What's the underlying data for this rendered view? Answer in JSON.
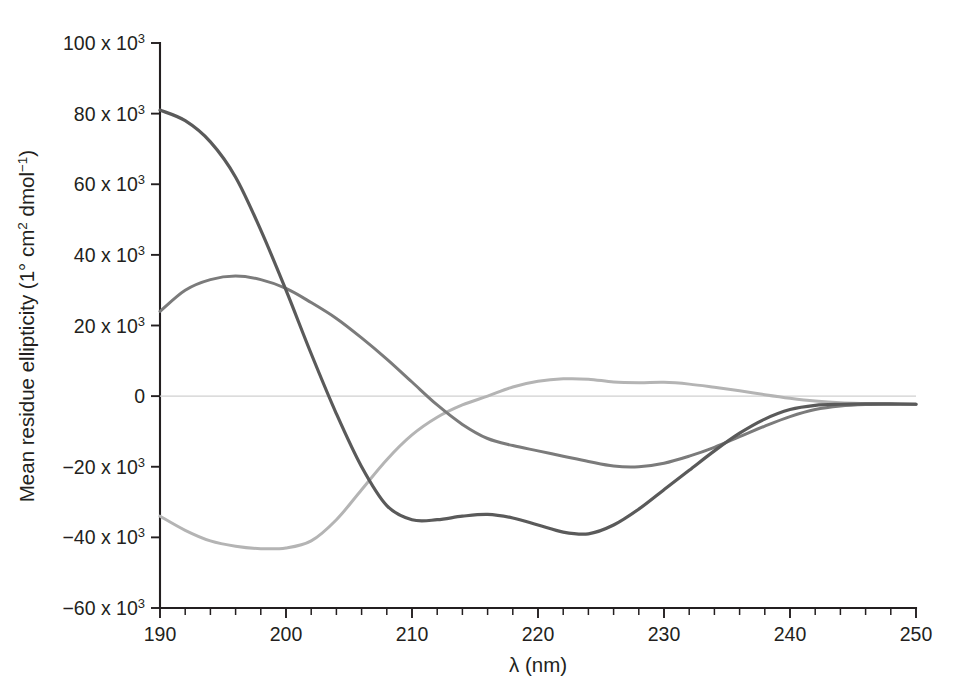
{
  "chart_data": {
    "type": "line",
    "title": "",
    "xlabel": "λ (nm)",
    "ylabel": "Mean residue ellipticity (1° cm2 dmol−1)",
    "ylabel_parts": {
      "lead": "Mean residue ellipticity (1° cm",
      "sup1": "2",
      "mid": " dmol",
      "sup2": "−1",
      "tail": ")"
    },
    "xlim": [
      190,
      250
    ],
    "ylim": [
      -60000,
      100000
    ],
    "grid": false,
    "legend": "none",
    "x_ticks_major": [
      190,
      200,
      210,
      220,
      230,
      240,
      250
    ],
    "x_tick_labels": [
      "190",
      "200",
      "210",
      "220",
      "230",
      "240",
      "250"
    ],
    "x_tick_minor_step": 2,
    "y_ticks_major": [
      100000,
      80000,
      60000,
      40000,
      20000,
      0,
      -20000,
      -40000,
      -60000
    ],
    "y_tick_labels": [
      {
        "mantissa": "100 x 10",
        "exponent": "3"
      },
      {
        "mantissa": "80 x 10",
        "exponent": "3"
      },
      {
        "mantissa": "60 x 10",
        "exponent": "3"
      },
      {
        "mantissa": "40 x 10",
        "exponent": "3"
      },
      {
        "mantissa": "20 x 10",
        "exponent": "3"
      },
      {
        "mantissa": "0",
        "exponent": ""
      },
      {
        "mantissa": "−20 x 10",
        "exponent": "3"
      },
      {
        "mantissa": "−40 x 10",
        "exponent": "3"
      },
      {
        "mantissa": "−60 x 10",
        "exponent": "3"
      }
    ],
    "x": [
      190,
      192,
      194,
      196,
      198,
      200,
      202,
      204,
      206,
      208,
      210,
      212,
      214,
      216,
      218,
      220,
      222,
      224,
      226,
      228,
      230,
      232,
      234,
      236,
      238,
      240,
      242,
      244,
      246,
      248,
      250
    ],
    "series": [
      {
        "name": "alpha-helix",
        "color": "#5a5a5a",
        "width": 3.2,
        "values": [
          81000,
          78000,
          72000,
          62000,
          47000,
          30000,
          12000,
          -5000,
          -20000,
          -31000,
          -35000,
          -35000,
          -34000,
          -33500,
          -34500,
          -36500,
          -38500,
          -39000,
          -36500,
          -32000,
          -26500,
          -21000,
          -15500,
          -10500,
          -6500,
          -3800,
          -2600,
          -2300,
          -2200,
          -2200,
          -2300
        ]
      },
      {
        "name": "beta-sheet",
        "color": "#7b7b7b",
        "width": 3.0,
        "values": [
          24000,
          30000,
          33000,
          34000,
          33000,
          30500,
          26500,
          22000,
          16500,
          10500,
          4000,
          -2500,
          -8000,
          -12000,
          -14000,
          -15500,
          -17000,
          -18500,
          -19800,
          -20000,
          -19000,
          -17000,
          -14500,
          -11500,
          -8500,
          -5800,
          -3800,
          -2800,
          -2400,
          -2300,
          -2300
        ]
      },
      {
        "name": "random-coil",
        "color": "#b4b4b4",
        "width": 3.0,
        "values": [
          -34000,
          -38000,
          -41000,
          -42500,
          -43200,
          -43000,
          -41000,
          -35000,
          -26500,
          -18000,
          -11000,
          -6000,
          -2500,
          0,
          2600,
          4200,
          4900,
          4800,
          4000,
          3800,
          3900,
          3400,
          2500,
          1500,
          400,
          -600,
          -1400,
          -1900,
          -2100,
          -2200,
          -2300
        ]
      }
    ],
    "baseline": {
      "name": "zero-baseline",
      "color": "#d0d0d0",
      "width": 1.4,
      "y": 0
    }
  },
  "geometry": {
    "x_axis_left_px": 160,
    "x_axis_right_px": 916,
    "y_axis_top_px": 43,
    "y_axis_bottom_px": 608
  }
}
